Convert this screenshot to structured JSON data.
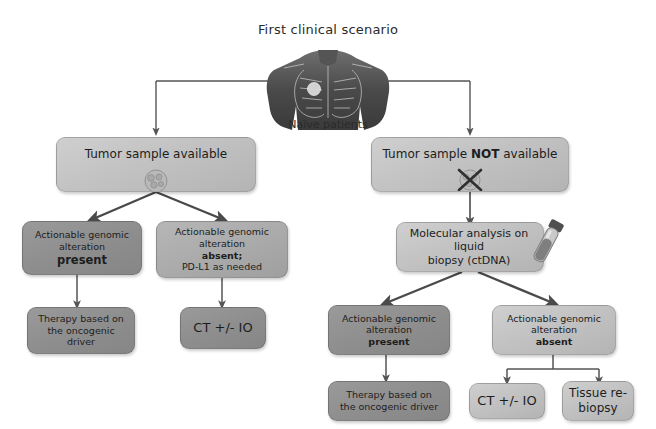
{
  "diagram": {
    "title": "First clinical scenario",
    "patient_caption": "Naïve patients",
    "icons": {
      "torso": "chest-torso-icon",
      "tumor": "tumor-cell-icon",
      "tumor_crossed": "tumor-cell-crossed-out-icon",
      "blood_tube": "blood-collection-tube-icon"
    },
    "colors": {
      "box_light": "#c4c4c4",
      "box_mid": "#ababab",
      "box_dark": "#8e8e8e",
      "connector": "#555555",
      "text": "#1d1d1d",
      "background": "#ffffff"
    },
    "nodes": {
      "tumor_available": "Tumor sample available",
      "tumor_not_available_prefix": "Tumor sample ",
      "tumor_not_available_bold": "NOT",
      "tumor_not_available_suffix": " available",
      "left_alteration_present_l1": "Actionable genomic",
      "left_alteration_present_l2": "alteration",
      "left_alteration_present_l3": "present",
      "left_alteration_absent_l1": "Actionable genomic",
      "left_alteration_absent_l2": "alteration",
      "left_alteration_absent_l3": "absent;",
      "left_alteration_absent_l4": "PD-L1 as needed",
      "left_therapy_l1": "Therapy based on",
      "left_therapy_l2": "the oncogenic",
      "left_therapy_l3": "driver",
      "left_ct_io": "CT +/- IO",
      "liquid_biopsy_l1": "Molecular analysis on liquid",
      "liquid_biopsy_l2": "biopsy (ctDNA)",
      "right_alteration_present_l1": "Actionable genomic",
      "right_alteration_present_l2": "alteration",
      "right_alteration_present_l3": "present",
      "right_alteration_absent_l1": "Actionable genomic",
      "right_alteration_absent_l2": "alteration",
      "right_alteration_absent_l3": "absent",
      "right_therapy_l1": "Therapy based on",
      "right_therapy_l2": "the oncogenic driver",
      "right_ct_io": "CT +/- IO",
      "tissue_rebiopsy_l1": "Tissue re-",
      "tissue_rebiopsy_l2": "biopsy"
    }
  }
}
